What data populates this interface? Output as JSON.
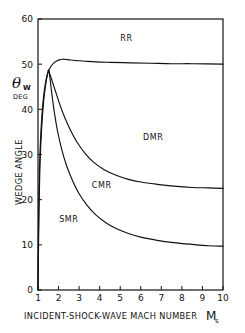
{
  "chart_data": {
    "type": "line",
    "title": "",
    "subtitle": "",
    "xlabel": "INCIDENT-SHOCK-WAVE MACH NUMBER",
    "xlabel_symbol": "M",
    "xlabel_symbol_sub": "s",
    "ylabel": "WEDGE ANGLE",
    "ylabel_symbol": "θ",
    "ylabel_symbol_sub": "W",
    "ylabel_units": "DEG",
    "xlim": [
      1,
      10
    ],
    "ylim": [
      0,
      60
    ],
    "xticks": [
      1,
      2,
      3,
      4,
      5,
      6,
      7,
      8,
      9,
      10
    ],
    "yticks": [
      0,
      10,
      20,
      30,
      40,
      50,
      60
    ],
    "xtick_labels": [
      "1",
      "2",
      "3",
      "4",
      "5",
      "6",
      "7",
      "8",
      "9",
      "10"
    ],
    "ytick_labels": [
      "0",
      "10",
      "20",
      "30",
      "40",
      "50",
      "60"
    ],
    "grid": false,
    "legend": "none",
    "line_color": "#111111",
    "annotations": [
      {
        "text": "RR",
        "x": 5.3,
        "y": 55.2,
        "name": "region-label-rr"
      },
      {
        "text": "DMR",
        "x": 6.6,
        "y": 33.3,
        "name": "region-label-dmr"
      },
      {
        "text": "CMR",
        "x": 4.1,
        "y": 22.6,
        "name": "region-label-cmr"
      },
      {
        "text": "SMR",
        "x": 2.5,
        "y": 15.1,
        "name": "region-label-smr"
      }
    ],
    "series": [
      {
        "name": "RR / MR transition boundary (detachment)",
        "points": [
          [
            1.0,
            0.0
          ],
          [
            1.02,
            12.0
          ],
          [
            1.05,
            22.0
          ],
          [
            1.08,
            28.0
          ],
          [
            1.12,
            33.0
          ],
          [
            1.18,
            38.0
          ],
          [
            1.25,
            42.0
          ],
          [
            1.35,
            45.5
          ],
          [
            1.45,
            47.6
          ],
          [
            1.6,
            49.3
          ],
          [
            1.8,
            50.4
          ],
          [
            2.0,
            50.9
          ],
          [
            2.2,
            51.1
          ],
          [
            2.45,
            51.0
          ],
          [
            2.8,
            50.8
          ],
          [
            3.2,
            50.7
          ],
          [
            3.8,
            50.5
          ],
          [
            4.5,
            50.4
          ],
          [
            5.5,
            50.3
          ],
          [
            6.5,
            50.2
          ],
          [
            7.5,
            50.1
          ],
          [
            8.5,
            50.1
          ],
          [
            10.0,
            50.0
          ]
        ]
      },
      {
        "name": "DMR / CMR transition boundary",
        "points": [
          [
            1.5,
            48.6
          ],
          [
            1.6,
            47.5
          ],
          [
            1.75,
            45.4
          ],
          [
            1.9,
            43.3
          ],
          [
            2.1,
            40.6
          ],
          [
            2.3,
            38.2
          ],
          [
            2.6,
            35.2
          ],
          [
            2.9,
            32.7
          ],
          [
            3.3,
            30.2
          ],
          [
            3.7,
            28.3
          ],
          [
            4.2,
            26.7
          ],
          [
            4.8,
            25.4
          ],
          [
            5.4,
            24.5
          ],
          [
            6.0,
            23.9
          ],
          [
            6.8,
            23.4
          ],
          [
            7.6,
            23.0
          ],
          [
            8.5,
            22.7
          ],
          [
            9.3,
            22.6
          ],
          [
            10.0,
            22.5
          ]
        ]
      },
      {
        "name": "CMR / SMR transition boundary",
        "points": [
          [
            1.0,
            0.0
          ],
          [
            1.05,
            18.0
          ],
          [
            1.1,
            28.0
          ],
          [
            1.18,
            36.0
          ],
          [
            1.28,
            42.0
          ],
          [
            1.38,
            45.6
          ],
          [
            1.46,
            47.8
          ],
          [
            1.52,
            48.7
          ],
          [
            1.58,
            47.0
          ],
          [
            1.68,
            43.2
          ],
          [
            1.8,
            39.2
          ],
          [
            1.95,
            35.2
          ],
          [
            2.15,
            31.2
          ],
          [
            2.4,
            27.4
          ],
          [
            2.7,
            24.0
          ],
          [
            3.0,
            21.3
          ],
          [
            3.4,
            18.7
          ],
          [
            3.8,
            16.7
          ],
          [
            4.3,
            14.9
          ],
          [
            4.8,
            13.6
          ],
          [
            5.4,
            12.5
          ],
          [
            6.0,
            11.7
          ],
          [
            6.8,
            11.0
          ],
          [
            7.6,
            10.5
          ],
          [
            8.5,
            10.1
          ],
          [
            9.3,
            9.8
          ],
          [
            10.0,
            9.7
          ]
        ]
      }
    ]
  }
}
